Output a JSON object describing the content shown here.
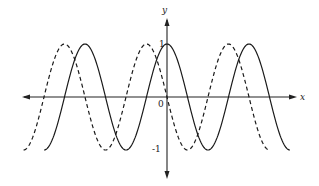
{
  "chart_data": {
    "type": "line",
    "title": "",
    "xlabel": "x",
    "ylabel": "y",
    "origin_label": "0",
    "y_ticks": [
      {
        "value": 1,
        "label": "1"
      },
      {
        "value": -1,
        "label": "-1"
      }
    ],
    "grid": false,
    "legend": null,
    "series": [
      {
        "name": "solid",
        "style": "solid",
        "function": "cos(x)",
        "x_range_periods": [
          -1.5,
          1.5
        ],
        "amplitude": 1
      },
      {
        "name": "dashed",
        "style": "dashed",
        "function": "cos(x + pi/2)",
        "phase_shift_periods": -0.25,
        "x_range_periods": [
          -1.5,
          1.5
        ],
        "amplitude": 1
      }
    ],
    "colors": {
      "line": "#1a1a1a",
      "axis": "#222222",
      "background": "#ffffff"
    }
  },
  "labels": {
    "x_axis": "x",
    "y_axis": "y",
    "origin": "0",
    "tick_pos": "1",
    "tick_neg": "-1"
  }
}
